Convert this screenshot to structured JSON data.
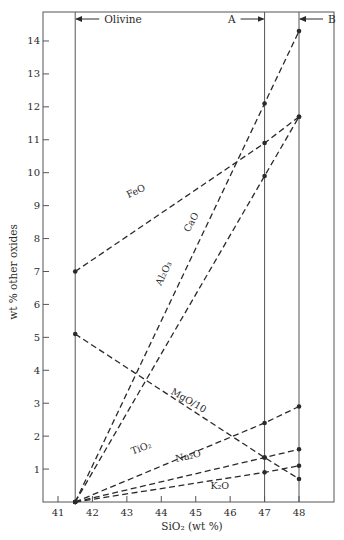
{
  "chart_data": {
    "type": "line",
    "title": "",
    "xlabel": "SiO₂ (wt %)",
    "ylabel": "wt % other oxides",
    "xlim": [
      40.55,
      48.7
    ],
    "ylim": [
      0,
      14.8
    ],
    "x_ticks": [
      41,
      42,
      43,
      44,
      45,
      46,
      47,
      48
    ],
    "y_ticks": [
      1,
      2,
      3,
      4,
      5,
      6,
      7,
      8,
      9,
      10,
      11,
      12,
      13,
      14
    ],
    "grid": false,
    "legend": "none (inline labels)",
    "reference_lines": [
      {
        "x": 41.5,
        "label": "Olivine",
        "arrow": "left",
        "label_side": "right"
      },
      {
        "x": 47,
        "label": "A",
        "arrow": "right",
        "label_side": "left"
      },
      {
        "x": 48,
        "label": "B",
        "arrow": "left",
        "label_side": "right"
      }
    ],
    "series": [
      {
        "name": "Al₂O₃",
        "x": [
          41.5,
          47,
          48
        ],
        "y": [
          0,
          12.1,
          14.3
        ],
        "style": "dashed"
      },
      {
        "name": "CaO",
        "x": [
          41.5,
          47,
          48
        ],
        "y": [
          0,
          9.9,
          11.7
        ],
        "style": "dashed"
      },
      {
        "name": "FeO",
        "x": [
          41.5,
          47,
          48
        ],
        "y": [
          7.0,
          10.9,
          11.7
        ],
        "style": "dashed"
      },
      {
        "name": "MgO/10",
        "x": [
          41.5,
          47,
          48
        ],
        "y": [
          5.1,
          1.35,
          0.7
        ],
        "style": "dashed"
      },
      {
        "name": "TiO₂",
        "x": [
          41.5,
          47,
          48
        ],
        "y": [
          0,
          2.4,
          2.9
        ],
        "style": "dashed"
      },
      {
        "name": "Na₂O",
        "x": [
          41.5,
          47,
          48
        ],
        "y": [
          0,
          1.35,
          1.6
        ],
        "style": "dashed"
      },
      {
        "name": "K₂O",
        "x": [
          41.5,
          47,
          48
        ],
        "y": [
          0,
          0.9,
          1.1
        ],
        "style": "dashed"
      }
    ],
    "series_label_positions": [
      {
        "name": "FeO",
        "x": 43.3,
        "y": 9.35,
        "angle": -26
      },
      {
        "name": "Al₂O₃",
        "x": 44.15,
        "y": 6.9,
        "angle": -64
      },
      {
        "name": "CaO",
        "x": 44.95,
        "y": 8.45,
        "angle": -61
      },
      {
        "name": "MgO/10",
        "x": 44.75,
        "y": 3.0,
        "angle": 30
      },
      {
        "name": "TiO₂",
        "x": 43.45,
        "y": 1.55,
        "angle": -20
      },
      {
        "name": "Na₂O",
        "x": 44.8,
        "y": 1.3,
        "angle": -13
      },
      {
        "name": "K₂O",
        "x": 45.7,
        "y": 0.4,
        "angle": 0
      }
    ],
    "colors": {
      "ink": "#2a2a2a",
      "frame": "#555555",
      "background": "#ffffff"
    }
  }
}
